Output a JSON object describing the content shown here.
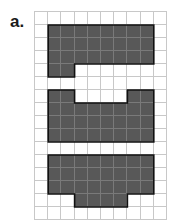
{
  "label": "a.",
  "grid": {
    "cols": 10,
    "rows": 16,
    "fill_color": "#585858",
    "line_color": "#c8c8c8",
    "shapes": [
      {
        "name": "shape-1",
        "cells": [
          [
            1,
            1
          ],
          [
            1,
            2
          ],
          [
            1,
            3
          ],
          [
            1,
            4
          ],
          [
            1,
            5
          ],
          [
            1,
            6
          ],
          [
            1,
            7
          ],
          [
            1,
            8
          ],
          [
            2,
            1
          ],
          [
            2,
            2
          ],
          [
            2,
            3
          ],
          [
            2,
            4
          ],
          [
            2,
            5
          ],
          [
            2,
            6
          ],
          [
            2,
            7
          ],
          [
            2,
            8
          ],
          [
            3,
            1
          ],
          [
            3,
            2
          ],
          [
            3,
            3
          ],
          [
            3,
            4
          ],
          [
            3,
            5
          ],
          [
            3,
            6
          ],
          [
            3,
            7
          ],
          [
            3,
            8
          ],
          [
            4,
            1
          ],
          [
            4,
            2
          ]
        ]
      },
      {
        "name": "shape-2",
        "cells": [
          [
            6,
            1
          ],
          [
            6,
            2
          ],
          [
            6,
            7
          ],
          [
            6,
            8
          ],
          [
            7,
            1
          ],
          [
            7,
            2
          ],
          [
            7,
            3
          ],
          [
            7,
            4
          ],
          [
            7,
            5
          ],
          [
            7,
            6
          ],
          [
            7,
            7
          ],
          [
            7,
            8
          ],
          [
            8,
            1
          ],
          [
            8,
            2
          ],
          [
            8,
            3
          ],
          [
            8,
            4
          ],
          [
            8,
            5
          ],
          [
            8,
            6
          ],
          [
            8,
            7
          ],
          [
            8,
            8
          ],
          [
            9,
            1
          ],
          [
            9,
            2
          ],
          [
            9,
            3
          ],
          [
            9,
            4
          ],
          [
            9,
            5
          ],
          [
            9,
            6
          ],
          [
            9,
            7
          ],
          [
            9,
            8
          ]
        ]
      },
      {
        "name": "shape-3",
        "cells": [
          [
            11,
            1
          ],
          [
            11,
            2
          ],
          [
            11,
            3
          ],
          [
            11,
            4
          ],
          [
            11,
            5
          ],
          [
            11,
            6
          ],
          [
            11,
            7
          ],
          [
            11,
            8
          ],
          [
            12,
            1
          ],
          [
            12,
            2
          ],
          [
            12,
            3
          ],
          [
            12,
            4
          ],
          [
            12,
            5
          ],
          [
            12,
            6
          ],
          [
            12,
            7
          ],
          [
            12,
            8
          ],
          [
            13,
            1
          ],
          [
            13,
            2
          ],
          [
            13,
            3
          ],
          [
            13,
            4
          ],
          [
            13,
            5
          ],
          [
            13,
            6
          ],
          [
            13,
            7
          ],
          [
            13,
            8
          ],
          [
            14,
            3
          ],
          [
            14,
            4
          ],
          [
            14,
            5
          ],
          [
            14,
            6
          ]
        ]
      }
    ]
  }
}
